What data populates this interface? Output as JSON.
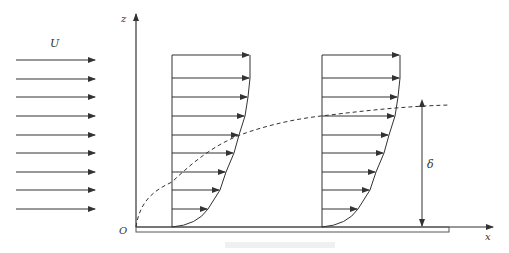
{
  "labels": {
    "freestream": "U",
    "z_axis": "z",
    "x_axis": "x",
    "origin": "O",
    "thickness": "δ"
  },
  "colors": {
    "stroke": "#333333",
    "plate": "#555555"
  },
  "freestream_arrows_y": [
    60,
    79,
    97,
    116,
    135,
    153,
    172,
    190,
    209
  ],
  "profiles": [
    {
      "x0": 172,
      "arrow_ends": [
        249,
        249,
        247,
        244,
        238,
        233,
        225,
        219,
        207
      ]
    },
    {
      "x0": 322,
      "arrow_ends": [
        399,
        399,
        397,
        394,
        388,
        383,
        375,
        369,
        357
      ]
    }
  ],
  "boundary_layer_edge": "dashed curve from O rising to delta at x ~ 450",
  "caption": ""
}
